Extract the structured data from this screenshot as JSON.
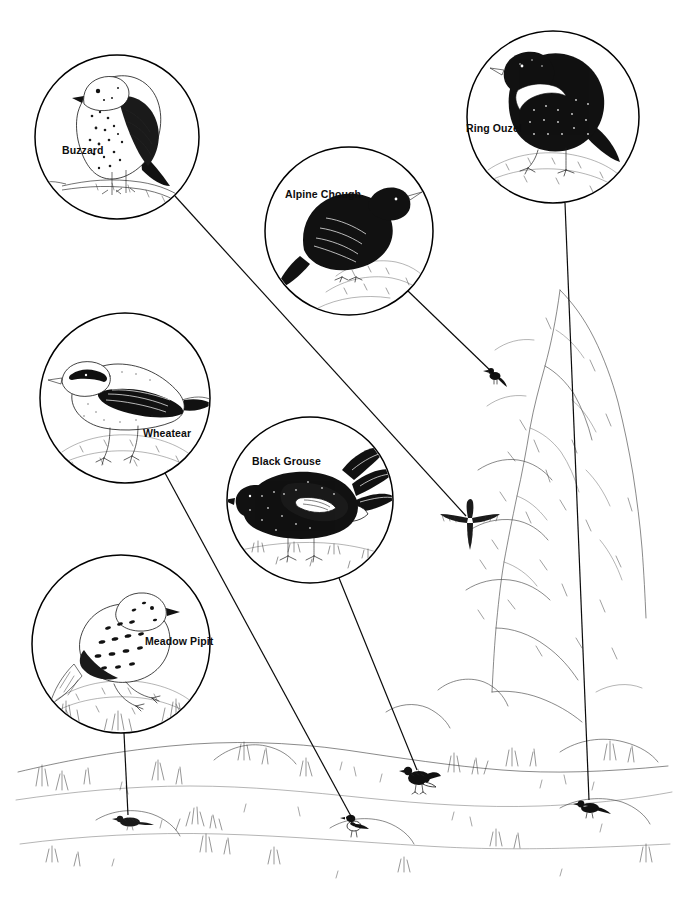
{
  "plate": {
    "title": "Upland and mountain birds",
    "medium": "pen-and-ink line illustration",
    "background_color": "#ffffff",
    "ink_color": "#111111",
    "width": 688,
    "height": 902
  },
  "callouts": [
    {
      "id": "buzzard",
      "label": "Buzzard",
      "label_x": 62,
      "label_y": 145,
      "circle": {
        "cx": 117,
        "cy": 137,
        "r": 82
      },
      "pose": "perched on bare branch, head turned left, mottled breast",
      "leader": {
        "x1": 175,
        "y1": 196,
        "x2": 466,
        "y2": 516
      },
      "target": {
        "x": 470,
        "y": 520,
        "description": "buzzard soaring against the crag"
      }
    },
    {
      "id": "alpine-chough",
      "label": "Alpine Chough",
      "label_x": 285,
      "label_y": 189,
      "circle": {
        "cx": 349,
        "cy": 231,
        "r": 84
      },
      "pose": "all-black crow-like bird standing on rock, pale bill",
      "leader": {
        "x1": 408,
        "y1": 291,
        "x2": 494,
        "y2": 374
      },
      "target": {
        "x": 495,
        "y": 376,
        "description": "small black chough silhouette on the crag ledge"
      }
    },
    {
      "id": "ring-ouzel",
      "label": "Ring Ouzel",
      "label_x": 466,
      "label_y": 123,
      "circle": {
        "cx": 553,
        "cy": 117,
        "r": 86
      },
      "pose": "black thrush with white crescent breast band, standing on stone",
      "leader": {
        "x1": 565,
        "y1": 203,
        "x2": 589,
        "y2": 800
      },
      "target": {
        "x": 590,
        "y": 808,
        "description": "ring ouzel on grassy slope, lower right"
      }
    },
    {
      "id": "wheatear",
      "label": "Wheatear",
      "label_x": 143,
      "label_y": 428,
      "circle": {
        "cx": 125,
        "cy": 398,
        "r": 85
      },
      "pose": "pale bird with black eye-stripe and dark wings, perched on a rock",
      "leader": {
        "x1": 165,
        "y1": 473,
        "x2": 352,
        "y2": 818
      },
      "target": {
        "x": 354,
        "y": 824,
        "description": "wheatear on a small grassy hummock, bottom centre"
      }
    },
    {
      "id": "black-grouse",
      "label": "Black Grouse",
      "label_x": 252,
      "label_y": 456,
      "circle": {
        "cx": 310,
        "cy": 500,
        "r": 83
      },
      "pose": "displaying blackcock with lyre tail fanned and white undertail",
      "leader": {
        "x1": 339,
        "y1": 578,
        "x2": 417,
        "y2": 770
      },
      "target": {
        "x": 419,
        "y": 778,
        "description": "black grouse feeding on grassland, lower middle right"
      }
    },
    {
      "id": "meadow-pipit",
      "label": "Meadow Pipit",
      "label_x": 145,
      "label_y": 636,
      "circle": {
        "cx": 121,
        "cy": 644,
        "r": 89
      },
      "pose": "streaked brown pipit standing on a tussock among grasses",
      "leader": {
        "x1": 124,
        "y1": 733,
        "x2": 128,
        "y2": 815
      },
      "target": {
        "x": 130,
        "y": 822,
        "description": "meadow pipit low in the grass, bottom left"
      }
    }
  ],
  "scene": {
    "description": "Rocky mountain crag on the right with open grassy upland in the foreground",
    "elements": [
      "rock crag / outcrop",
      "boulders",
      "tussock grass",
      "open moorland ground"
    ]
  }
}
